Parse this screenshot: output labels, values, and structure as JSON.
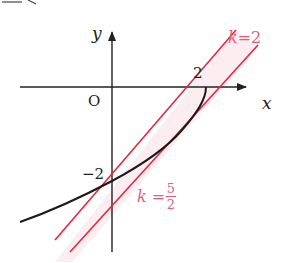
{
  "top_cropped_text": "y = 2",
  "axes": {
    "x_label": "x",
    "y_label": "y",
    "origin_label": "O"
  },
  "ticks": {
    "x_tick": "2",
    "y_tick": "−2"
  },
  "lines": {
    "upper": {
      "label_k": "k",
      "label_eq": "=",
      "label_value": "2"
    },
    "lower": {
      "label_k": "k",
      "label_eq": "=",
      "label_num": "5",
      "label_den": "2"
    }
  },
  "colors": {
    "axis": "#222222",
    "curve": "#1a1a1a",
    "lines": "#e8253d",
    "band": "#fbe9ee",
    "label": "#e0607a"
  }
}
